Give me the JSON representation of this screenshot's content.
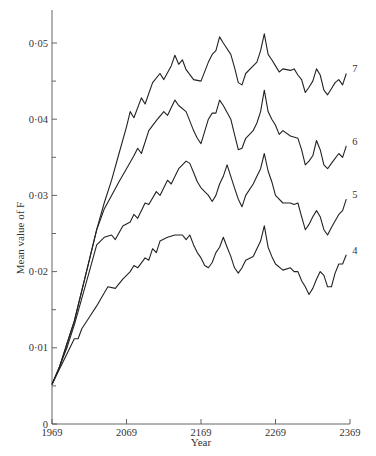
{
  "chart_data": {
    "type": "line",
    "title": "",
    "xlabel": "Year",
    "ylabel": "Mean value of F",
    "xlim": [
      1969,
      2369
    ],
    "ylim": [
      0,
      0.055
    ],
    "grid": false,
    "legend": "inline end labels at right of each curve",
    "x_ticks": [
      1969,
      2069,
      2169,
      2269,
      2369
    ],
    "x_tick_labels": [
      "1969",
      "2069",
      "2169",
      "2269",
      "2369"
    ],
    "y_ticks": [
      0,
      0.01,
      0.02,
      0.03,
      0.04,
      0.05
    ],
    "y_tick_labels": [
      "0",
      "0·01",
      "0·02",
      "0·03",
      "0·04",
      "0·05"
    ],
    "y_minor_ticks": [
      0.005,
      0.015,
      0.025,
      0.035,
      0.045
    ],
    "series": [
      {
        "name": "7",
        "points": [
          [
            1969,
            0.0052
          ],
          [
            1979,
            0.0075
          ],
          [
            1989,
            0.0105
          ],
          [
            1999,
            0.0135
          ],
          [
            2009,
            0.0175
          ],
          [
            2019,
            0.0215
          ],
          [
            2029,
            0.0255
          ],
          [
            2039,
            0.029
          ],
          [
            2049,
            0.032
          ],
          [
            2059,
            0.0355
          ],
          [
            2069,
            0.039
          ],
          [
            2074,
            0.041
          ],
          [
            2079,
            0.0402
          ],
          [
            2089,
            0.0428
          ],
          [
            2094,
            0.042
          ],
          [
            2104,
            0.0448
          ],
          [
            2114,
            0.046
          ],
          [
            2119,
            0.0452
          ],
          [
            2129,
            0.047
          ],
          [
            2134,
            0.0484
          ],
          [
            2139,
            0.0472
          ],
          [
            2144,
            0.0478
          ],
          [
            2149,
            0.0465
          ],
          [
            2159,
            0.0452
          ],
          [
            2169,
            0.045
          ],
          [
            2179,
            0.0475
          ],
          [
            2184,
            0.0485
          ],
          [
            2189,
            0.049
          ],
          [
            2194,
            0.0508
          ],
          [
            2199,
            0.05
          ],
          [
            2209,
            0.0485
          ],
          [
            2214,
            0.0468
          ],
          [
            2219,
            0.0448
          ],
          [
            2224,
            0.0445
          ],
          [
            2229,
            0.046
          ],
          [
            2239,
            0.047
          ],
          [
            2244,
            0.0475
          ],
          [
            2249,
            0.049
          ],
          [
            2254,
            0.0512
          ],
          [
            2259,
            0.0485
          ],
          [
            2264,
            0.0478
          ],
          [
            2269,
            0.047
          ],
          [
            2274,
            0.0462
          ],
          [
            2279,
            0.0466
          ],
          [
            2289,
            0.0464
          ],
          [
            2294,
            0.0466
          ],
          [
            2299,
            0.0458
          ],
          [
            2304,
            0.0452
          ],
          [
            2309,
            0.0435
          ],
          [
            2314,
            0.0442
          ],
          [
            2319,
            0.045
          ],
          [
            2324,
            0.0466
          ],
          [
            2329,
            0.0458
          ],
          [
            2334,
            0.0438
          ],
          [
            2339,
            0.0432
          ],
          [
            2344,
            0.044
          ],
          [
            2349,
            0.0448
          ],
          [
            2354,
            0.0452
          ],
          [
            2359,
            0.0445
          ],
          [
            2364,
            0.046
          ]
        ]
      },
      {
        "name": "6",
        "points": [
          [
            1969,
            0.0052
          ],
          [
            1979,
            0.0075
          ],
          [
            1989,
            0.0105
          ],
          [
            1999,
            0.0135
          ],
          [
            2009,
            0.0175
          ],
          [
            2019,
            0.0215
          ],
          [
            2029,
            0.0255
          ],
          [
            2039,
            0.0282
          ],
          [
            2049,
            0.03
          ],
          [
            2059,
            0.0318
          ],
          [
            2069,
            0.0335
          ],
          [
            2079,
            0.0352
          ],
          [
            2084,
            0.0362
          ],
          [
            2089,
            0.0355
          ],
          [
            2099,
            0.0385
          ],
          [
            2109,
            0.0398
          ],
          [
            2119,
            0.041
          ],
          [
            2124,
            0.0405
          ],
          [
            2134,
            0.0425
          ],
          [
            2139,
            0.0418
          ],
          [
            2149,
            0.041
          ],
          [
            2159,
            0.0385
          ],
          [
            2164,
            0.0375
          ],
          [
            2169,
            0.0368
          ],
          [
            2179,
            0.04
          ],
          [
            2184,
            0.0408
          ],
          [
            2189,
            0.0408
          ],
          [
            2194,
            0.0425
          ],
          [
            2199,
            0.0418
          ],
          [
            2209,
            0.04
          ],
          [
            2214,
            0.038
          ],
          [
            2219,
            0.036
          ],
          [
            2224,
            0.0362
          ],
          [
            2229,
            0.0375
          ],
          [
            2239,
            0.0385
          ],
          [
            2244,
            0.0395
          ],
          [
            2249,
            0.041
          ],
          [
            2254,
            0.0438
          ],
          [
            2259,
            0.041
          ],
          [
            2264,
            0.04
          ],
          [
            2269,
            0.0392
          ],
          [
            2274,
            0.038
          ],
          [
            2279,
            0.0385
          ],
          [
            2289,
            0.0378
          ],
          [
            2299,
            0.0375
          ],
          [
            2304,
            0.036
          ],
          [
            2309,
            0.034
          ],
          [
            2314,
            0.0345
          ],
          [
            2319,
            0.0352
          ],
          [
            2324,
            0.0372
          ],
          [
            2329,
            0.036
          ],
          [
            2334,
            0.034
          ],
          [
            2339,
            0.0335
          ],
          [
            2344,
            0.0342
          ],
          [
            2354,
            0.0355
          ],
          [
            2359,
            0.035
          ],
          [
            2364,
            0.0365
          ]
        ]
      },
      {
        "name": "5",
        "points": [
          [
            1969,
            0.0052
          ],
          [
            1979,
            0.0075
          ],
          [
            1989,
            0.01
          ],
          [
            1999,
            0.013
          ],
          [
            2009,
            0.0165
          ],
          [
            2019,
            0.02
          ],
          [
            2029,
            0.0235
          ],
          [
            2039,
            0.0245
          ],
          [
            2049,
            0.0248
          ],
          [
            2054,
            0.0242
          ],
          [
            2064,
            0.026
          ],
          [
            2074,
            0.0265
          ],
          [
            2079,
            0.0275
          ],
          [
            2084,
            0.027
          ],
          [
            2094,
            0.029
          ],
          [
            2099,
            0.0288
          ],
          [
            2109,
            0.0305
          ],
          [
            2114,
            0.03
          ],
          [
            2124,
            0.032
          ],
          [
            2129,
            0.0315
          ],
          [
            2139,
            0.0335
          ],
          [
            2149,
            0.0345
          ],
          [
            2154,
            0.0342
          ],
          [
            2159,
            0.033
          ],
          [
            2164,
            0.0318
          ],
          [
            2169,
            0.031
          ],
          [
            2179,
            0.03
          ],
          [
            2184,
            0.0292
          ],
          [
            2189,
            0.03
          ],
          [
            2194,
            0.0315
          ],
          [
            2199,
            0.0325
          ],
          [
            2204,
            0.034
          ],
          [
            2209,
            0.0325
          ],
          [
            2214,
            0.031
          ],
          [
            2219,
            0.0295
          ],
          [
            2224,
            0.0285
          ],
          [
            2229,
            0.03
          ],
          [
            2239,
            0.0315
          ],
          [
            2244,
            0.0325
          ],
          [
            2249,
            0.0335
          ],
          [
            2254,
            0.0355
          ],
          [
            2259,
            0.0332
          ],
          [
            2264,
            0.0318
          ],
          [
            2269,
            0.03
          ],
          [
            2279,
            0.029
          ],
          [
            2289,
            0.029
          ],
          [
            2294,
            0.0288
          ],
          [
            2299,
            0.029
          ],
          [
            2304,
            0.0272
          ],
          [
            2309,
            0.0255
          ],
          [
            2314,
            0.0262
          ],
          [
            2319,
            0.0272
          ],
          [
            2324,
            0.028
          ],
          [
            2329,
            0.0272
          ],
          [
            2334,
            0.0255
          ],
          [
            2339,
            0.0248
          ],
          [
            2344,
            0.0258
          ],
          [
            2354,
            0.0275
          ],
          [
            2359,
            0.028
          ],
          [
            2364,
            0.0295
          ]
        ]
      },
      {
        "name": "4",
        "points": [
          [
            1969,
            0.0052
          ],
          [
            1979,
            0.0072
          ],
          [
            1989,
            0.0092
          ],
          [
            1999,
            0.0112
          ],
          [
            2004,
            0.0112
          ],
          [
            2009,
            0.0125
          ],
          [
            2019,
            0.014
          ],
          [
            2029,
            0.0155
          ],
          [
            2039,
            0.0172
          ],
          [
            2044,
            0.018
          ],
          [
            2054,
            0.0178
          ],
          [
            2064,
            0.019
          ],
          [
            2074,
            0.02
          ],
          [
            2079,
            0.0208
          ],
          [
            2084,
            0.0205
          ],
          [
            2094,
            0.0218
          ],
          [
            2099,
            0.0215
          ],
          [
            2104,
            0.023
          ],
          [
            2109,
            0.0225
          ],
          [
            2114,
            0.024
          ],
          [
            2124,
            0.0245
          ],
          [
            2134,
            0.0248
          ],
          [
            2144,
            0.0248
          ],
          [
            2149,
            0.0242
          ],
          [
            2154,
            0.0248
          ],
          [
            2159,
            0.0235
          ],
          [
            2164,
            0.0225
          ],
          [
            2169,
            0.0218
          ],
          [
            2174,
            0.0208
          ],
          [
            2179,
            0.0205
          ],
          [
            2184,
            0.0212
          ],
          [
            2189,
            0.0225
          ],
          [
            2194,
            0.0232
          ],
          [
            2199,
            0.0245
          ],
          [
            2204,
            0.0232
          ],
          [
            2209,
            0.022
          ],
          [
            2214,
            0.0205
          ],
          [
            2219,
            0.0198
          ],
          [
            2224,
            0.0205
          ],
          [
            2229,
            0.0215
          ],
          [
            2239,
            0.022
          ],
          [
            2244,
            0.023
          ],
          [
            2249,
            0.024
          ],
          [
            2254,
            0.026
          ],
          [
            2259,
            0.0232
          ],
          [
            2264,
            0.022
          ],
          [
            2269,
            0.021
          ],
          [
            2279,
            0.0202
          ],
          [
            2289,
            0.0205
          ],
          [
            2294,
            0.02
          ],
          [
            2299,
            0.02
          ],
          [
            2304,
            0.0188
          ],
          [
            2309,
            0.018
          ],
          [
            2314,
            0.017
          ],
          [
            2319,
            0.0178
          ],
          [
            2324,
            0.019
          ],
          [
            2329,
            0.02
          ],
          [
            2334,
            0.0195
          ],
          [
            2339,
            0.018
          ],
          [
            2344,
            0.018
          ],
          [
            2349,
            0.0198
          ],
          [
            2354,
            0.021
          ],
          [
            2359,
            0.021
          ],
          [
            2364,
            0.0222
          ]
        ]
      }
    ]
  }
}
